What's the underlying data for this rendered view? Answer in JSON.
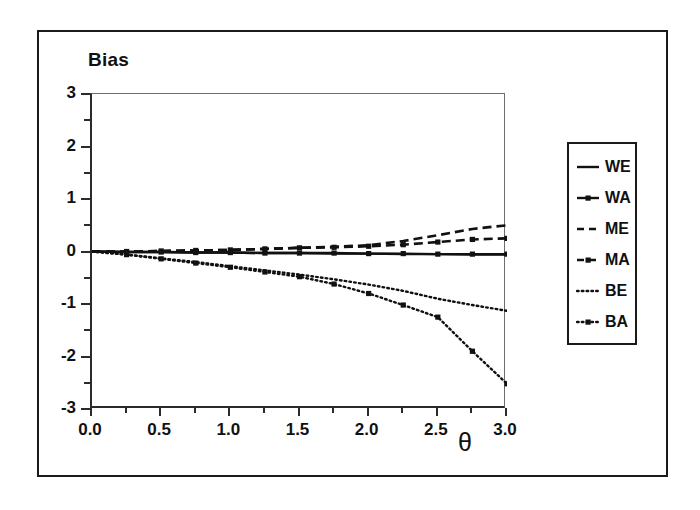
{
  "chart_data": {
    "type": "line",
    "title": "Bias",
    "xlabel": "θ",
    "ylabel": "Bias",
    "xlim": [
      0.0,
      3.0
    ],
    "ylim": [
      -3,
      3
    ],
    "grid": false,
    "legend_position": "right-outside",
    "xticks": [
      "0.0",
      "0.5",
      "1.0",
      "1.5",
      "2.0",
      "2.5",
      "3.0"
    ],
    "xtick_values": [
      0.0,
      0.5,
      1.0,
      1.5,
      2.0,
      2.5,
      3.0
    ],
    "xminor_values": [
      0.25,
      0.75,
      1.25,
      1.75,
      2.25,
      2.75
    ],
    "yticks": [
      "3",
      "2",
      "1",
      "0",
      "-1",
      "-2",
      "-3"
    ],
    "ytick_values": [
      3,
      2,
      1,
      0,
      -1,
      -2,
      -3
    ],
    "yminor_values": [
      2.5,
      1.5,
      0.5,
      -0.5,
      -1.5,
      -2.5
    ],
    "x": [
      0.0,
      0.25,
      0.5,
      0.75,
      1.0,
      1.25,
      1.5,
      1.75,
      2.0,
      2.25,
      2.5,
      2.75,
      3.0
    ],
    "series": [
      {
        "name": "WE",
        "style": "solid",
        "marker": "none",
        "color": "#111111",
        "values": [
          0.0,
          -0.01,
          -0.01,
          -0.02,
          -0.02,
          -0.03,
          -0.03,
          -0.04,
          -0.04,
          -0.05,
          -0.05,
          -0.06,
          -0.06
        ]
      },
      {
        "name": "WA",
        "style": "solid",
        "marker": "square",
        "color": "#111111",
        "values": [
          0.0,
          -0.01,
          -0.01,
          -0.02,
          -0.02,
          -0.03,
          -0.03,
          -0.03,
          -0.04,
          -0.04,
          -0.05,
          -0.05,
          -0.05
        ]
      },
      {
        "name": "ME",
        "style": "dashed",
        "marker": "none",
        "color": "#111111",
        "values": [
          0.0,
          0.0,
          0.01,
          0.02,
          0.03,
          0.05,
          0.07,
          0.09,
          0.12,
          0.2,
          0.31,
          0.43,
          0.5
        ]
      },
      {
        "name": "MA",
        "style": "dashed",
        "marker": "square",
        "color": "#111111",
        "values": [
          0.0,
          0.0,
          0.01,
          0.02,
          0.03,
          0.05,
          0.07,
          0.08,
          0.1,
          0.13,
          0.18,
          0.23,
          0.25
        ]
      },
      {
        "name": "BE",
        "style": "dotted",
        "marker": "none",
        "color": "#111111",
        "values": [
          0.0,
          -0.06,
          -0.13,
          -0.2,
          -0.28,
          -0.36,
          -0.44,
          -0.53,
          -0.63,
          -0.75,
          -0.9,
          -1.02,
          -1.13
        ]
      },
      {
        "name": "BA",
        "style": "dotted",
        "marker": "square",
        "color": "#111111",
        "values": [
          0.0,
          -0.06,
          -0.14,
          -0.22,
          -0.3,
          -0.39,
          -0.48,
          -0.62,
          -0.8,
          -1.02,
          -1.25,
          -1.9,
          -2.52
        ]
      }
    ]
  },
  "legend": {
    "entries": [
      {
        "label": "WE"
      },
      {
        "label": "WA"
      },
      {
        "label": "ME"
      },
      {
        "label": "MA"
      },
      {
        "label": "BE"
      },
      {
        "label": "BA"
      }
    ]
  }
}
